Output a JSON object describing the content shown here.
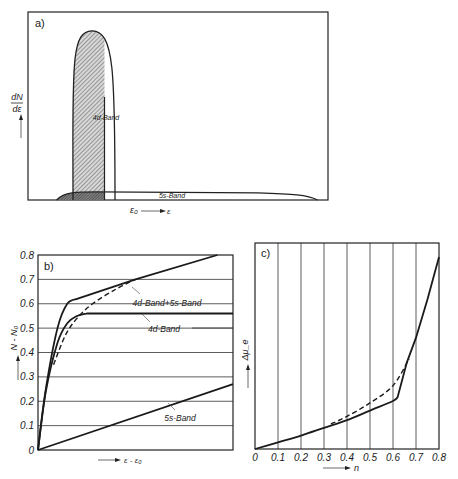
{
  "chart_data": [
    {
      "panel": "a",
      "type": "area",
      "panel_label": "a)",
      "ylabel_num": "dN",
      "ylabel_den": "dε",
      "xlabel_origin": "ε₀",
      "xlabel": "ε",
      "x_range": [
        0,
        1
      ],
      "e0": 0.255,
      "series": [
        {
          "name": "4d-Band",
          "label": "4d-Band",
          "x_start": 0.15,
          "x_end": 0.29,
          "peak_x": 0.25,
          "peak_height": 0.94,
          "filled_to": 0.255
        },
        {
          "name": "5s-Band",
          "label": "5s-Band",
          "x_start": 0.095,
          "x_end": 0.965,
          "height": 0.045
        }
      ]
    },
    {
      "panel": "b",
      "type": "line",
      "panel_label": "b)",
      "ylabel": "N - N₀",
      "xlabel": "ε - ε₀",
      "ylim": [
        0,
        0.8
      ],
      "xlim": [
        0,
        1
      ],
      "yticks": [
        "0",
        "0.1",
        "0.2",
        "0.3",
        "0.4",
        "0.5",
        "0.6",
        "0.7",
        "0.8"
      ],
      "grid": "horizontal",
      "series": [
        {
          "name": "4d-Band+5s-Band",
          "label": "4d-Band+5s-Band",
          "style": "solid",
          "points": [
            [
              0,
              0
            ],
            [
              0.04,
              0.25
            ],
            [
              0.1,
              0.5
            ],
            [
              0.15,
              0.6
            ],
            [
              0.2,
              0.62
            ],
            [
              0.5,
              0.7
            ],
            [
              0.92,
              0.8
            ]
          ]
        },
        {
          "name": "4d-Band",
          "label": "4d-Band",
          "style": "solid",
          "points": [
            [
              0,
              0
            ],
            [
              0.04,
              0.24
            ],
            [
              0.1,
              0.44
            ],
            [
              0.15,
              0.52
            ],
            [
              0.2,
              0.55
            ],
            [
              0.25,
              0.56
            ],
            [
              1.0,
              0.56
            ]
          ]
        },
        {
          "name": "4d+5s (smoothed)",
          "label": "",
          "style": "dashed",
          "points": [
            [
              0.08,
              0.35
            ],
            [
              0.14,
              0.47
            ],
            [
              0.2,
              0.54
            ],
            [
              0.28,
              0.6
            ],
            [
              0.4,
              0.66
            ],
            [
              0.5,
              0.7
            ]
          ]
        },
        {
          "name": "5s-Band",
          "label": "5s-Band",
          "style": "solid",
          "points": [
            [
              0,
              0
            ],
            [
              1.0,
              0.27
            ]
          ]
        }
      ]
    },
    {
      "panel": "c",
      "type": "line",
      "panel_label": "c)",
      "ylabel": "Δμ_e",
      "xlabel": "n",
      "xlim": [
        0,
        0.8
      ],
      "ylim": [
        0,
        1
      ],
      "xticks": [
        "0",
        "0.1",
        "0.2",
        "0.3",
        "0.4",
        "0.5",
        "0.6",
        "0.7",
        "0.8"
      ],
      "grid": "vertical",
      "series": [
        {
          "name": "Δμe solid",
          "style": "solid",
          "points": [
            [
              0,
              0
            ],
            [
              0.1,
              0.035
            ],
            [
              0.2,
              0.07
            ],
            [
              0.3,
              0.11
            ],
            [
              0.4,
              0.15
            ],
            [
              0.5,
              0.2
            ],
            [
              0.6,
              0.25
            ],
            [
              0.62,
              0.27
            ],
            [
              0.66,
              0.45
            ],
            [
              0.7,
              0.58
            ],
            [
              0.75,
              0.78
            ],
            [
              0.8,
              1.0
            ]
          ]
        },
        {
          "name": "Δμe dashed",
          "style": "dashed",
          "points": [
            [
              0.33,
              0.13
            ],
            [
              0.4,
              0.17
            ],
            [
              0.5,
              0.24
            ],
            [
              0.6,
              0.33
            ],
            [
              0.67,
              0.47
            ]
          ]
        }
      ]
    }
  ]
}
